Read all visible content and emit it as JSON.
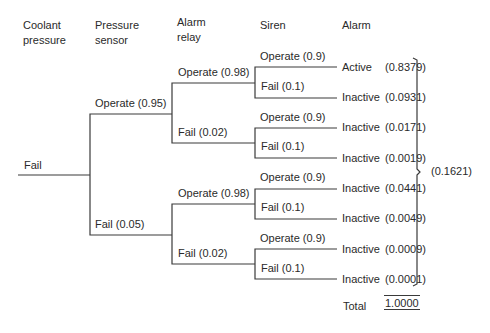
{
  "headers": {
    "col1": "Coolant\npressure",
    "col2": "Pressure\nsensor",
    "col3": "Alarm\nrelay",
    "col4": "Siren",
    "col5": "Alarm"
  },
  "root": {
    "label": "Fail"
  },
  "pressure_sensor": {
    "operate": "Operate (0.95)",
    "fail": "Fail (0.05)"
  },
  "alarm_relay": [
    {
      "operate": "Operate (0.98)",
      "fail": "Fail (0.02)"
    },
    {
      "operate": "Operate (0.98)",
      "fail": "Fail (0.02)"
    }
  ],
  "siren": [
    {
      "operate": "Operate (0.9)",
      "fail": "Fail (0.1)"
    },
    {
      "operate": "Operate (0.9)",
      "fail": "Fail (0.1)"
    },
    {
      "operate": "Operate (0.9)",
      "fail": "Fail (0.1)"
    },
    {
      "operate": "Operate (0.9)",
      "fail": "Fail (0.1)"
    }
  ],
  "outcomes": [
    {
      "state": "Active",
      "prob": "(0.8379)"
    },
    {
      "state": "Inactive",
      "prob": "(0.0931)"
    },
    {
      "state": "Inactive",
      "prob": "(0.0171)"
    },
    {
      "state": "Inactive",
      "prob": "(0.0019)"
    },
    {
      "state": "Inactive",
      "prob": "(0.0441)"
    },
    {
      "state": "Inactive",
      "prob": "(0.0049)"
    },
    {
      "state": "Inactive",
      "prob": "(0.0009)"
    },
    {
      "state": "Inactive",
      "prob": "(0.0001)"
    }
  ],
  "inactive_sum": "(0.1621)",
  "total": {
    "label": "Total",
    "value": "1.0000"
  }
}
